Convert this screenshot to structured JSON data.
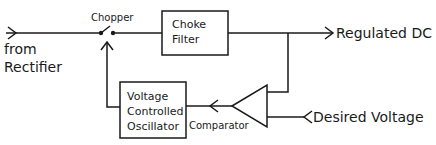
{
  "diagram": {
    "nodes": {
      "input": {
        "label_line1": "from",
        "label_line2": "Rectifier"
      },
      "chopper": {
        "label": "Chopper"
      },
      "choke_filter": {
        "label_line1": "Choke",
        "label_line2": "Filter"
      },
      "output": {
        "label": "Regulated DC"
      },
      "vco": {
        "label_line1": "Voltage",
        "label_line2": "Controlled",
        "label_line3": "Oscillator"
      },
      "comparator": {
        "label": "Comparator"
      },
      "reference": {
        "label": "Desired Voltage"
      }
    },
    "edges": [
      {
        "from": "input",
        "to": "chopper"
      },
      {
        "from": "chopper",
        "to": "choke_filter"
      },
      {
        "from": "choke_filter",
        "to": "output"
      },
      {
        "from": "choke_filter",
        "to": "comparator"
      },
      {
        "from": "reference",
        "to": "comparator"
      },
      {
        "from": "comparator",
        "to": "vco"
      },
      {
        "from": "vco",
        "to": "chopper"
      }
    ],
    "colors": {
      "stroke": "#1a1a1a",
      "background": "#ffffff"
    }
  }
}
